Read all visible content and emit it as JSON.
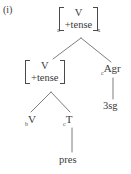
{
  "figure": {
    "example_label": "(i)",
    "type": "syntax-tree",
    "ink_color": "#3a3a3a",
    "background_color": "#ffffff"
  },
  "tree": {
    "root": {
      "id": "root",
      "kind": "feature-matrix",
      "left_subscript": "a",
      "right_subscript": "x",
      "rows": [
        "V",
        "+tense"
      ]
    },
    "inner": {
      "id": "inner",
      "kind": "feature-matrix",
      "left_subscript": "",
      "right_subscript": "",
      "rows": [
        "V",
        "+tense"
      ]
    },
    "agr": {
      "id": "agr",
      "kind": "category",
      "left_subscript": "c",
      "label": "Agr"
    },
    "v": {
      "id": "v",
      "kind": "category",
      "left_subscript": "b",
      "label": "V"
    },
    "t": {
      "id": "t",
      "kind": "category",
      "left_subscript": "c",
      "label": "T"
    },
    "agr_leaf": {
      "id": "agr-leaf",
      "kind": "terminal",
      "label": "3sg"
    },
    "t_leaf": {
      "id": "t-leaf",
      "kind": "terminal",
      "label": "pres"
    }
  }
}
